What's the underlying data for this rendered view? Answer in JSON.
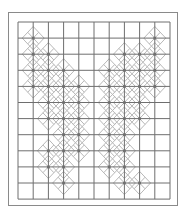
{
  "figure": {
    "grid": {
      "columns": 10,
      "rows": 11,
      "x0": 18,
      "y0": 22,
      "cell_w": 15.2,
      "cell_h": 16.1
    },
    "colors": {
      "grid_line": "#6e6e6e",
      "diamond_line": "#b8b8b8",
      "dot": "#707070",
      "frame": "#8a8a8a"
    },
    "dots": [
      [
        1,
        1
      ],
      [
        9,
        1
      ],
      [
        1,
        2
      ],
      [
        2,
        2
      ],
      [
        7,
        2
      ],
      [
        8,
        2
      ],
      [
        9,
        2
      ],
      [
        1,
        3
      ],
      [
        2,
        3
      ],
      [
        3,
        3
      ],
      [
        6,
        3
      ],
      [
        7,
        3
      ],
      [
        8,
        3
      ],
      [
        9,
        3
      ],
      [
        1,
        4
      ],
      [
        2,
        4
      ],
      [
        3,
        4
      ],
      [
        4,
        4
      ],
      [
        6,
        4
      ],
      [
        7,
        4
      ],
      [
        8,
        4
      ],
      [
        9,
        4
      ],
      [
        2,
        5
      ],
      [
        3,
        5
      ],
      [
        4,
        5
      ],
      [
        6,
        5
      ],
      [
        7,
        5
      ],
      [
        8,
        5
      ],
      [
        2,
        6
      ],
      [
        3,
        6
      ],
      [
        4,
        6
      ],
      [
        6,
        6
      ],
      [
        7,
        6
      ],
      [
        8,
        6
      ],
      [
        3,
        7
      ],
      [
        4,
        7
      ],
      [
        6,
        7
      ],
      [
        7,
        7
      ],
      [
        2,
        8
      ],
      [
        3,
        8
      ],
      [
        4,
        8
      ],
      [
        6,
        8
      ],
      [
        7,
        8
      ],
      [
        2,
        9
      ],
      [
        3,
        9
      ],
      [
        6,
        9
      ],
      [
        7,
        9
      ],
      [
        3,
        10
      ],
      [
        7,
        10
      ],
      [
        8,
        10
      ]
    ]
  }
}
